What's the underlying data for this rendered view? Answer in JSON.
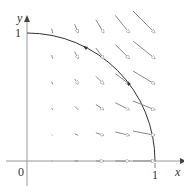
{
  "figure": {
    "type": "vector-field-plot",
    "axes": {
      "x_label": "x",
      "y_label": "y",
      "origin_label": "0",
      "x_tick_label": "1",
      "y_tick_label": "1"
    },
    "curve": {
      "description": "quarter circle x^2+y^2=1 from (0,1) to (1,0)",
      "color": "#333333"
    },
    "field": {
      "description": "vector field F(x,y) = (x^2, -xy) sampled on grid",
      "x_values": [
        0.2,
        0.4,
        0.6,
        0.8,
        1.0
      ],
      "y_values": [
        0,
        0.2,
        0.4,
        0.6,
        0.8,
        1.0
      ],
      "color": "#888888"
    },
    "colors": {
      "axis": "#999999",
      "curve": "#333333",
      "arrow": "#8a8a8a",
      "background": "#ffffff"
    }
  }
}
